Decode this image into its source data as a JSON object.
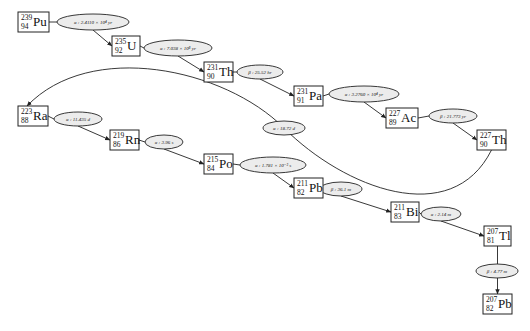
{
  "diagram": {
    "title": "",
    "type": "decay-chain",
    "nodes": [
      {
        "id": "pu239",
        "mass": "239",
        "z": "94",
        "symbol": "Pu",
        "x": 18,
        "y": 12,
        "w": 31,
        "h": 20
      },
      {
        "id": "u235",
        "mass": "235",
        "z": "92",
        "symbol": "U",
        "x": 112,
        "y": 36,
        "w": 28,
        "h": 20
      },
      {
        "id": "th231",
        "mass": "231",
        "z": "90",
        "symbol": "Th",
        "x": 204,
        "y": 62,
        "w": 29,
        "h": 20
      },
      {
        "id": "pa231",
        "mass": "231",
        "z": "91",
        "symbol": "Pa",
        "x": 294,
        "y": 86,
        "w": 29,
        "h": 20
      },
      {
        "id": "ac227",
        "mass": "227",
        "z": "89",
        "symbol": "Ac",
        "x": 386,
        "y": 108,
        "w": 32,
        "h": 20
      },
      {
        "id": "th227",
        "mass": "227",
        "z": "90",
        "symbol": "Th",
        "x": 477,
        "y": 130,
        "w": 29,
        "h": 20
      },
      {
        "id": "ra223",
        "mass": "223",
        "z": "88",
        "symbol": "Ra",
        "x": 18,
        "y": 106,
        "w": 30,
        "h": 20
      },
      {
        "id": "rn219",
        "mass": "219",
        "z": "86",
        "symbol": "Rn",
        "x": 110,
        "y": 130,
        "w": 29,
        "h": 20
      },
      {
        "id": "po215",
        "mass": "215",
        "z": "84",
        "symbol": "Po",
        "x": 204,
        "y": 154,
        "w": 29,
        "h": 20
      },
      {
        "id": "pb211",
        "mass": "211",
        "z": "82",
        "symbol": "Pb",
        "x": 294,
        "y": 178,
        "w": 29,
        "h": 20
      },
      {
        "id": "bi211",
        "mass": "211",
        "z": "83",
        "symbol": "Bi",
        "x": 391,
        "y": 202,
        "w": 28,
        "h": 20
      },
      {
        "id": "tl207",
        "mass": "207",
        "z": "81",
        "symbol": "Tl",
        "x": 484,
        "y": 226,
        "w": 27,
        "h": 20
      },
      {
        "id": "pb207",
        "mass": "207",
        "z": "82",
        "symbol": "Pb",
        "x": 483,
        "y": 294,
        "w": 29,
        "h": 20
      }
    ],
    "edges": [
      {
        "from": "pu239",
        "to": "u235",
        "label": "α : 2.4110 × 10⁴ yr",
        "cx": 93,
        "cy": 22,
        "rx": 36,
        "ry": 8
      },
      {
        "from": "u235",
        "to": "th231",
        "label": "α : 7.038 × 10⁸ yr",
        "cx": 178,
        "cy": 48,
        "rx": 34,
        "ry": 8
      },
      {
        "from": "th231",
        "to": "pa231",
        "label": "β : 25.52 hr",
        "cx": 260,
        "cy": 72,
        "rx": 23,
        "ry": 7
      },
      {
        "from": "pa231",
        "to": "ac227",
        "label": "α : 3.2760 × 10⁴ yr",
        "cx": 364,
        "cy": 94,
        "rx": 35,
        "ry": 8
      },
      {
        "from": "ac227",
        "to": "th227",
        "label": "β : 21.773 yr",
        "cx": 453,
        "cy": 116,
        "rx": 24,
        "ry": 7
      },
      {
        "from": "th227",
        "to": "ra223",
        "label": "α : 18.72 d",
        "cx": 284,
        "cy": 128,
        "rx": 21,
        "ry": 7
      },
      {
        "from": "ra223",
        "to": "rn219",
        "label": "α : 11.435 d",
        "cx": 78,
        "cy": 119,
        "rx": 24,
        "ry": 7
      },
      {
        "from": "rn219",
        "to": "po215",
        "label": "α : 3.96 s",
        "cx": 164,
        "cy": 142,
        "rx": 19,
        "ry": 7
      },
      {
        "from": "po215",
        "to": "pb211",
        "label": "α : 1.781 × 10⁻³ s",
        "cx": 273,
        "cy": 165,
        "rx": 33,
        "ry": 8
      },
      {
        "from": "pb211",
        "to": "bi211",
        "label": "β : 36.1 m",
        "cx": 341,
        "cy": 189,
        "rx": 21,
        "ry": 7
      },
      {
        "from": "bi211",
        "to": "tl207",
        "label": "α : 2.14 m",
        "cx": 441,
        "cy": 214,
        "rx": 20,
        "ry": 7
      },
      {
        "from": "tl207",
        "to": "pb207",
        "label": "β : 4.77 m",
        "cx": 497,
        "cy": 271,
        "rx": 21,
        "ry": 7
      }
    ]
  }
}
